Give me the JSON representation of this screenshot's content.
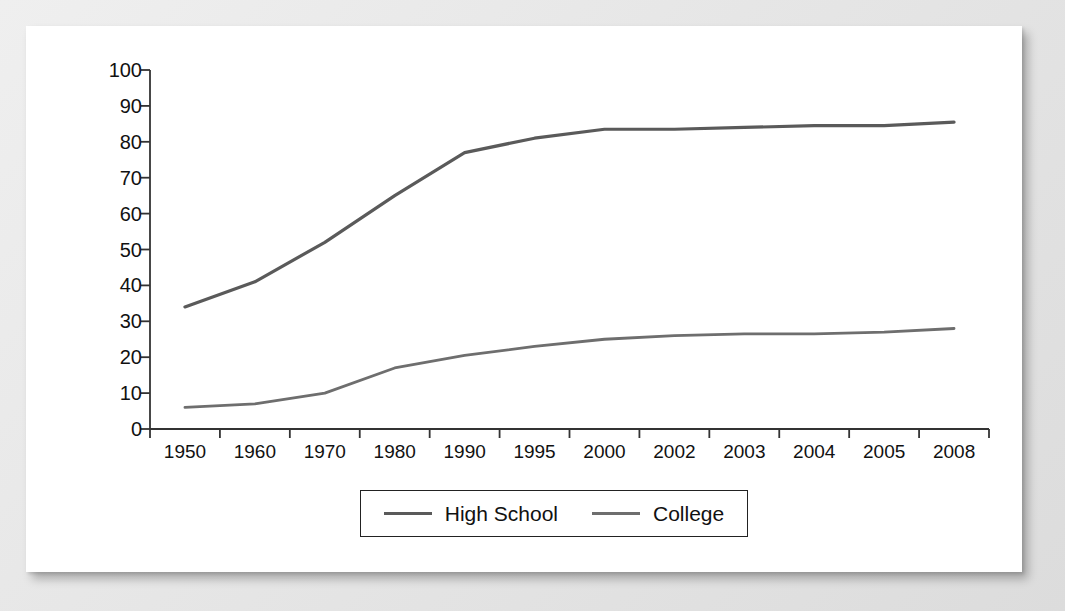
{
  "chart_data": {
    "type": "line",
    "title": "",
    "subtitle": "",
    "xlabel": "",
    "ylabel": "",
    "categories": [
      "1950",
      "1960",
      "1970",
      "1980",
      "1990",
      "1995",
      "2000",
      "2002",
      "2003",
      "2004",
      "2005",
      "2008"
    ],
    "series": [
      {
        "name": "High School",
        "color": "#5a5a5a",
        "values": [
          34,
          41,
          52,
          65,
          77,
          81,
          83.5,
          83.5,
          84,
          84.5,
          84.5,
          85.5
        ]
      },
      {
        "name": "College",
        "color": "#6e6e6e",
        "values": [
          6,
          7,
          10,
          17,
          20.5,
          23,
          25,
          26,
          26.5,
          26.5,
          27,
          28
        ]
      }
    ],
    "ylim": [
      0,
      100
    ],
    "yticks": [
      0,
      10,
      20,
      30,
      40,
      50,
      60,
      70,
      80,
      90,
      100
    ],
    "ytick_labels": [
      "0",
      "10",
      "20",
      "30",
      "40",
      "50",
      "60",
      "70",
      "80",
      "90",
      "100"
    ],
    "grid": false,
    "legend_position": "bottom-center",
    "axis_color": "#333333",
    "card_background": "#ffffff",
    "page_background": "#e6e6e6"
  },
  "legend": {
    "items": [
      {
        "label": "High School",
        "swatch": "line-swatch-high-school"
      },
      {
        "label": "College",
        "swatch": "line-swatch-college"
      }
    ]
  }
}
